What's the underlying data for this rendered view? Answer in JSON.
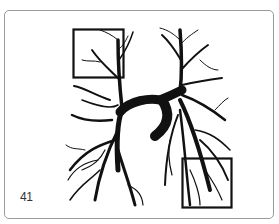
{
  "figure": {
    "number_label": "41",
    "highlight_boxes": [
      {
        "name": "top-left-box",
        "x": 73,
        "y": 29,
        "width": 51,
        "height": 49
      },
      {
        "name": "bottom-right-box",
        "x": 182,
        "y": 158,
        "width": 50,
        "height": 50
      }
    ],
    "colors": {
      "ink": "#111111",
      "frame": "#9a9a9a",
      "background": "#ffffff"
    }
  }
}
